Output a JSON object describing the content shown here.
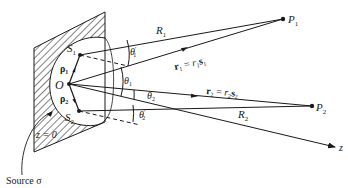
{
  "diagram": {
    "type": "scattering geometry",
    "colors": {
      "ink": "#1a1a1a",
      "background": "#ffffff"
    },
    "points": {
      "origin": {
        "label": "O",
        "x": 69,
        "y": 84
      },
      "S1": {
        "label": "S",
        "sub": "1",
        "x": 80,
        "y": 55
      },
      "S2": {
        "label": "S",
        "sub": "2",
        "x": 79,
        "y": 111
      },
      "P1": {
        "label": "P",
        "sub": "1",
        "x": 283,
        "y": 19
      },
      "P2": {
        "label": "P",
        "sub": "2",
        "x": 312,
        "y": 106
      }
    },
    "labels": {
      "R1": "R",
      "R1_sub": "1",
      "R2": "R",
      "R2_sub": "2",
      "rho1": "ρ",
      "rho1_sub": "1",
      "rho2": "ρ",
      "rho2_sub": "2",
      "theta1": "θ",
      "theta1_sub": "1",
      "theta1p": "θ",
      "theta1p_sub": "1",
      "theta1p_prime": "′",
      "theta2": "θ",
      "theta2_sub": "2",
      "theta2p": "θ",
      "theta2p_sub": "2",
      "theta2p_prime": "′",
      "r1_lhs": "r",
      "r1_lhs_sub": "1",
      "r1_eq": " = ",
      "r1_r": "r",
      "r1_r_sub": "1",
      "r1_s": "s",
      "r1_s_sub": "1",
      "r2_lhs": "r",
      "r2_lhs_sub": "2",
      "r2_eq": " = ",
      "r2_r": "r",
      "r2_r_sub": "2",
      "r2_s": "s",
      "r2_s_sub": "2",
      "z_axis": "z",
      "plane": "z = 0",
      "source": "Source σ"
    }
  }
}
